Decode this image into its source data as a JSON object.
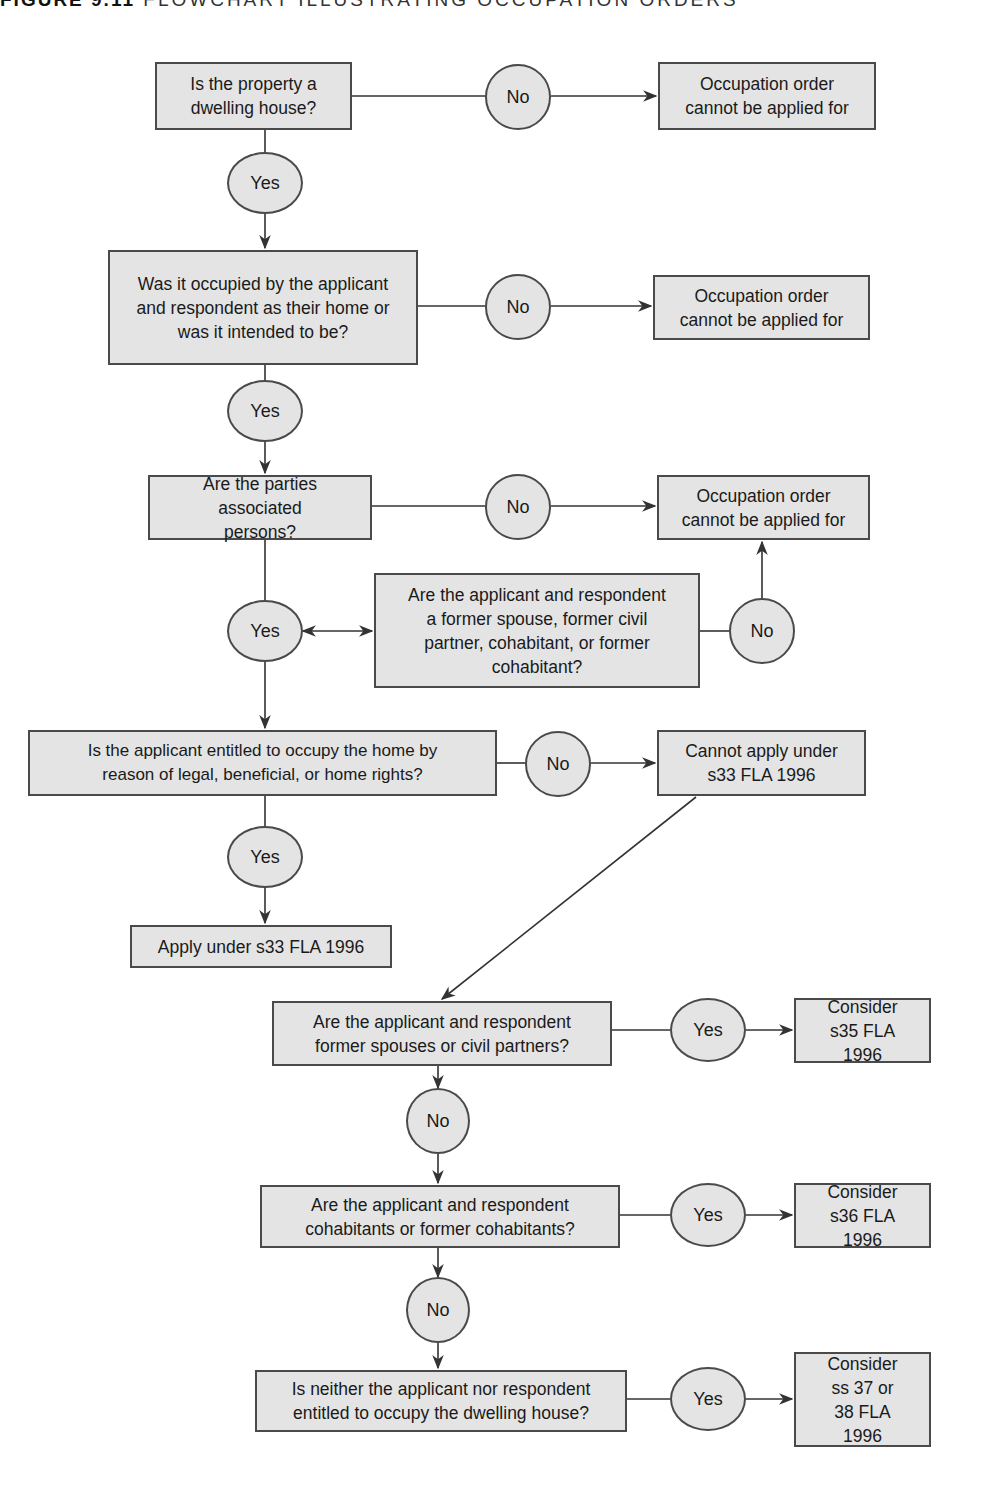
{
  "figure": {
    "label": "FIGURE 9.11",
    "title": "FLOWCHART ILLUSTRATING OCCUPATION ORDERS"
  },
  "colors": {
    "box_fill": "#e4e4e4",
    "border": "#4a4a4a",
    "line": "#333333",
    "background": "#ffffff"
  },
  "decisions": {
    "q1": "Is the property a dwelling house?",
    "q2": "Was it occupied by the applicant and respondent as their home or was it intended to be?",
    "q3": "Are the parties associated persons?",
    "q3b": "Are the applicant and respondent a former spouse, former civil partner, cohabitant, or former cohabitant?",
    "q4": "Is the applicant entitled to occupy the home by reason of legal, beneficial, or home rights?",
    "q5": "Are the applicant and respondent former spouses or civil partners?",
    "q6": "Are the applicant and respondent cohabitants or former cohabitants?",
    "q7": "Is neither the applicant nor respondent entitled to occupy the dwelling house?"
  },
  "outcomes": {
    "o1": "Occupation order cannot be applied for",
    "o2": "Occupation order cannot be applied for",
    "o3": "Occupation order cannot be applied for",
    "o4": "Cannot apply under s33 FLA 1996",
    "o5": "Apply under s33 FLA 1996",
    "o6": "Consider s35 FLA 1996",
    "o7": "Consider s36 FLA 1996",
    "o8": "Consider ss 37 or 38 FLA 1996"
  },
  "labels": {
    "yes": "Yes",
    "no": "No"
  }
}
